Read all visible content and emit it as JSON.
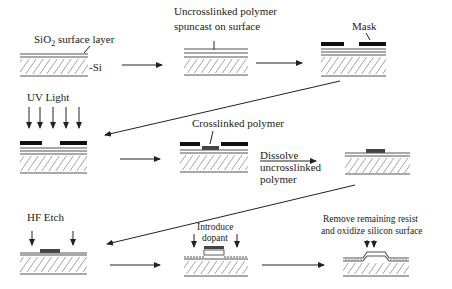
{
  "diagram": {
    "steps": [
      {
        "id": 1,
        "labels": [
          "SiO2 surface layer",
          "Si"
        ],
        "sio2_base": "SiO",
        "sio2_sub": "2",
        "sio2_rest": " surface layer",
        "si": "-Si"
      },
      {
        "id": 2,
        "labels": [
          "Uncrosslinked polymer",
          "spuncast on surface"
        ]
      },
      {
        "id": 3,
        "labels": [
          "Mask"
        ]
      },
      {
        "id": 4,
        "labels": [
          "UV Light"
        ]
      },
      {
        "id": 5,
        "labels": [
          "Crosslinked polymer"
        ]
      },
      {
        "id": 6,
        "labels": [
          "Dissolve",
          "uncrosslinked",
          "polymer"
        ]
      },
      {
        "id": 7,
        "labels": [
          "HF Etch"
        ]
      },
      {
        "id": 8,
        "labels": [
          "Introduce",
          "dopant"
        ]
      },
      {
        "id": 9,
        "labels": [
          "Remove remaining resist",
          "and oxidize silicon surface"
        ]
      }
    ],
    "colors": {
      "line": "#222222",
      "substrate": "#555555",
      "polymer": "#444444",
      "mask": "#111111",
      "background": "#ffffff"
    }
  }
}
